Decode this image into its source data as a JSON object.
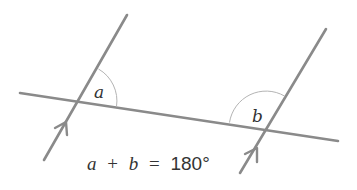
{
  "diagram": {
    "colors": {
      "line": "#8a8a8a",
      "arc": "#b4b4b4",
      "text": "#333333",
      "background": "#ffffff"
    },
    "angle_labels": {
      "a": "a",
      "b": "b"
    },
    "equation": {
      "var_a": "a",
      "plus": "+",
      "var_b": "b",
      "equals": "=",
      "value": "180°"
    },
    "lines": {
      "parallel_left": {
        "x1": 127,
        "y1": 15,
        "x2": 44,
        "y2": 160
      },
      "parallel_right": {
        "x1": 326,
        "y1": 29,
        "x2": 240,
        "y2": 173
      },
      "transversal": {
        "x1": 20,
        "y1": 93,
        "x2": 338,
        "y2": 141
      }
    },
    "parallel_markers": [
      "arrow-left-line",
      "arrow-right-line"
    ]
  }
}
